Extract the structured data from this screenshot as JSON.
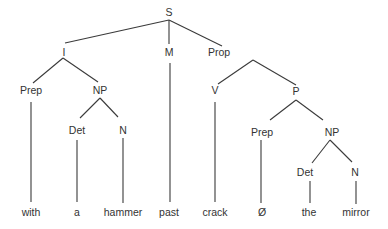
{
  "diagram": {
    "type": "syntax-tree",
    "nodes": [
      {
        "id": "S",
        "label": "S",
        "x": 169,
        "y": 16
      },
      {
        "id": "I",
        "label": "I",
        "x": 64,
        "y": 56
      },
      {
        "id": "M",
        "label": "M",
        "x": 169,
        "y": 56
      },
      {
        "id": "Prop",
        "label": "Prop",
        "x": 219,
        "y": 56
      },
      {
        "id": "Prep1",
        "label": "Prep",
        "x": 31,
        "y": 94
      },
      {
        "id": "NP1",
        "label": "NP",
        "x": 100,
        "y": 94
      },
      {
        "id": "V",
        "label": "V",
        "x": 215,
        "y": 94
      },
      {
        "id": "P",
        "label": "P",
        "x": 296,
        "y": 95
      },
      {
        "id": "Det1",
        "label": "Det",
        "x": 77,
        "y": 134
      },
      {
        "id": "N1",
        "label": "N",
        "x": 123,
        "y": 134
      },
      {
        "id": "Prep2",
        "label": "Prep",
        "x": 262,
        "y": 136
      },
      {
        "id": "NP2",
        "label": "NP",
        "x": 332,
        "y": 136
      },
      {
        "id": "Det2",
        "label": "Det",
        "x": 305,
        "y": 176
      },
      {
        "id": "N2",
        "label": "N",
        "x": 355,
        "y": 176
      },
      {
        "id": "w_with",
        "label": "with",
        "x": 31,
        "y": 216
      },
      {
        "id": "w_a",
        "label": "a",
        "x": 77,
        "y": 216
      },
      {
        "id": "w_hammer",
        "label": "hammer",
        "x": 123,
        "y": 216
      },
      {
        "id": "w_past",
        "label": "past",
        "x": 169,
        "y": 216
      },
      {
        "id": "w_crack",
        "label": "crack",
        "x": 215,
        "y": 216
      },
      {
        "id": "w_null",
        "label": "Ø",
        "x": 262,
        "y": 216
      },
      {
        "id": "w_the",
        "label": "the",
        "x": 309,
        "y": 216
      },
      {
        "id": "w_mirror",
        "label": "mirror",
        "x": 356,
        "y": 216
      }
    ],
    "edges": [
      {
        "from": "S",
        "to": "I",
        "x1": 169,
        "y1": 20,
        "x2": 65,
        "y2": 43
      },
      {
        "from": "S",
        "to": "M",
        "x1": 169,
        "y1": 20,
        "x2": 169,
        "y2": 44
      },
      {
        "from": "S",
        "to": "Prop",
        "x1": 169,
        "y1": 20,
        "x2": 222,
        "y2": 46
      },
      {
        "from": "I",
        "to": "Prep1",
        "x1": 63,
        "y1": 58,
        "x2": 33,
        "y2": 83
      },
      {
        "from": "I",
        "to": "NP1",
        "x1": 63,
        "y1": 58,
        "x2": 98,
        "y2": 82
      },
      {
        "from": "Prop",
        "to": "V",
        "x1": 253,
        "y1": 60,
        "x2": 218,
        "y2": 84
      },
      {
        "from": "Prop",
        "to": "P",
        "x1": 253,
        "y1": 60,
        "x2": 296,
        "y2": 85
      },
      {
        "from": "NP1",
        "to": "Det1",
        "x1": 100,
        "y1": 98,
        "x2": 80,
        "y2": 118
      },
      {
        "from": "NP1",
        "to": "N1",
        "x1": 100,
        "y1": 98,
        "x2": 118,
        "y2": 117
      },
      {
        "from": "P",
        "to": "Prep2",
        "x1": 296,
        "y1": 100,
        "x2": 270,
        "y2": 120
      },
      {
        "from": "P",
        "to": "NP2",
        "x1": 296,
        "y1": 100,
        "x2": 323,
        "y2": 120
      },
      {
        "from": "NP2",
        "to": "Det2",
        "x1": 330,
        "y1": 140,
        "x2": 312,
        "y2": 163
      },
      {
        "from": "NP2",
        "to": "N2",
        "x1": 330,
        "y1": 140,
        "x2": 352,
        "y2": 162
      },
      {
        "from": "Prep1",
        "to": "w_with",
        "x1": 31,
        "y1": 102,
        "x2": 31,
        "y2": 202
      },
      {
        "from": "M",
        "to": "w_past",
        "x1": 170,
        "y1": 63,
        "x2": 170,
        "y2": 202
      },
      {
        "from": "Det1",
        "to": "w_a",
        "x1": 77,
        "y1": 140,
        "x2": 77,
        "y2": 202
      },
      {
        "from": "N1",
        "to": "w_hammer",
        "x1": 123,
        "y1": 138,
        "x2": 123,
        "y2": 203
      },
      {
        "from": "V",
        "to": "w_crack",
        "x1": 215,
        "y1": 102,
        "x2": 215,
        "y2": 202
      },
      {
        "from": "Prep2",
        "to": "w_null",
        "x1": 261,
        "y1": 140,
        "x2": 261,
        "y2": 203
      },
      {
        "from": "Det2",
        "to": "w_the",
        "x1": 310,
        "y1": 181,
        "x2": 310,
        "y2": 203
      },
      {
        "from": "N2",
        "to": "w_mirror",
        "x1": 356,
        "y1": 181,
        "x2": 356,
        "y2": 204
      }
    ]
  }
}
